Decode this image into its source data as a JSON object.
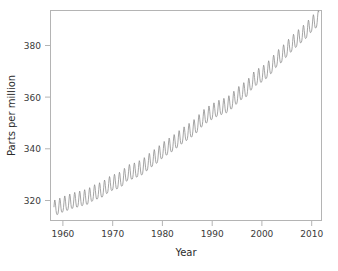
{
  "figure": {
    "background_color": "#ffffff",
    "frame_color": "#b4b4b4",
    "width": 338,
    "height": 271
  },
  "axis": {
    "x_title": "Year",
    "y_title": "Parts per million",
    "x_tick_labels": [
      "1960",
      "1970",
      "1980",
      "1990",
      "2000",
      "2010"
    ],
    "y_tick_labels": [
      "320",
      "340",
      "360",
      "380"
    ]
  },
  "chart_data": {
    "type": "line",
    "title": "",
    "xlabel": "Year",
    "ylabel": "Parts per million",
    "xlim": [
      1957.5,
      2012.0
    ],
    "ylim": [
      311.0,
      396.0
    ],
    "xticks": [
      1960,
      1970,
      1980,
      1990,
      2000,
      2010
    ],
    "yticks": [
      320,
      340,
      360,
      380
    ],
    "grid": false,
    "legend": "none",
    "line_color": "#8e8e8e",
    "line_width": 0.8,
    "series": [
      {
        "name": "Atmospheric CO2 concentration (Mauna Loa)",
        "description": "Monthly mean CO2 in parts per million showing a rising trend with an annual seasonal sawtooth oscillation of roughly 6 ppm peak-to-trough.",
        "annual_means": {
          "x": [
            1958,
            1959,
            1960,
            1961,
            1962,
            1963,
            1964,
            1965,
            1966,
            1967,
            1968,
            1969,
            1970,
            1971,
            1972,
            1973,
            1974,
            1975,
            1976,
            1977,
            1978,
            1979,
            1980,
            1981,
            1982,
            1983,
            1984,
            1985,
            1986,
            1987,
            1988,
            1989,
            1990,
            1991,
            1992,
            1993,
            1994,
            1995,
            1996,
            1997,
            1998,
            1999,
            2000,
            2001,
            2002,
            2003,
            2004,
            2005,
            2006,
            2007,
            2008,
            2009,
            2010,
            2011
          ],
          "y": [
            315.3,
            315.9,
            316.9,
            317.6,
            318.4,
            318.9,
            319.5,
            320.0,
            321.4,
            322.2,
            323.0,
            324.6,
            325.7,
            326.3,
            327.5,
            329.7,
            330.2,
            331.1,
            332.0,
            333.8,
            335.4,
            336.8,
            338.7,
            340.1,
            341.4,
            343.0,
            344.6,
            346.0,
            347.4,
            349.2,
            351.6,
            353.1,
            354.4,
            355.6,
            356.4,
            357.1,
            358.8,
            360.8,
            362.6,
            363.7,
            366.7,
            368.4,
            369.5,
            371.1,
            373.2,
            375.8,
            377.5,
            379.8,
            381.9,
            383.8,
            385.6,
            387.4,
            389.9,
            391.6
          ]
        },
        "seasonal_amplitude_ppm": 6.2,
        "seasonal_peak_month": "May",
        "seasonal_trough_month": "September",
        "first_value": 315.3,
        "last_value": 393.0,
        "n_years": 54
      }
    ]
  }
}
